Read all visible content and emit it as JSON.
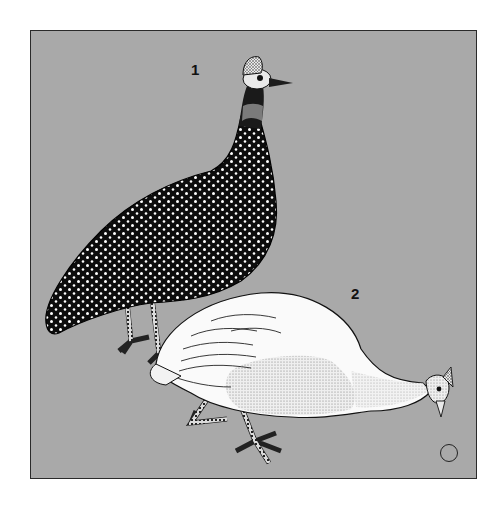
{
  "plate": {
    "background_color": "#a9a9a9",
    "border_color": "#2a2a2a"
  },
  "figures": [
    {
      "label": "1",
      "subject": "dark spotted guinea fowl standing",
      "body_color": "#111111",
      "spot_color": "#ffffff"
    },
    {
      "label": "2",
      "subject": "white guinea fowl pecking at ground",
      "body_color": "#f7f7f7",
      "stipple_color": "#c9c9c9"
    }
  ],
  "symbol": {
    "name": "circle-marker",
    "glyph": "○"
  }
}
